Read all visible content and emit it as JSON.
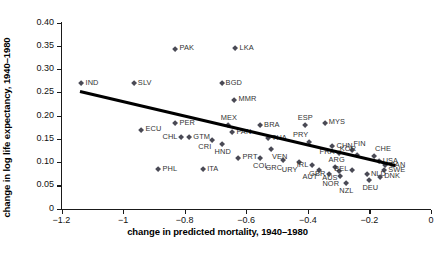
{
  "chart_data": {
    "type": "scatter",
    "title": "",
    "xlabel": "change in predicted mortality, 1940–1980",
    "ylabel": "change in log life expectancy, 1940–1980",
    "xlim": [
      -1.2,
      0.0
    ],
    "ylim": [
      0.0,
      0.4
    ],
    "xticks": [
      "−1.2",
      "−1",
      "−0.8",
      "−0.6",
      "−0.4",
      "−0.2",
      "0"
    ],
    "xtick_values": [
      -1.2,
      -1.0,
      -0.8,
      -0.6,
      -0.4,
      -0.2,
      0.0
    ],
    "yticks": [
      "0",
      "0.05",
      "0.10",
      "0.15",
      "0.20",
      "0.25",
      "0.30",
      "0.35",
      "0.40"
    ],
    "ytick_values": [
      0.0,
      0.05,
      0.1,
      0.15,
      0.2,
      0.25,
      0.3,
      0.35,
      0.4
    ],
    "grid": false,
    "legend": "none",
    "marker_color": "#4a4a55",
    "line_color": "#000000",
    "trendline": {
      "x0": -1.14,
      "y0": 0.2555,
      "x1": -0.115,
      "y1": 0.0965
    },
    "points": [
      {
        "label": "IND",
        "x": -1.135,
        "y": 0.2695,
        "pos": "r"
      },
      {
        "label": "SLV",
        "x": -0.965,
        "y": 0.269,
        "pos": "r"
      },
      {
        "label": "PAK",
        "x": -0.83,
        "y": 0.3435,
        "pos": "r"
      },
      {
        "label": "LKA",
        "x": -0.635,
        "y": 0.345,
        "pos": "r"
      },
      {
        "label": "BGD",
        "x": -0.68,
        "y": 0.269,
        "pos": "r"
      },
      {
        "label": "MMR",
        "x": -0.638,
        "y": 0.2335,
        "pos": "r"
      },
      {
        "label": "ECU",
        "x": -0.94,
        "y": 0.169,
        "pos": "r"
      },
      {
        "label": "PHL",
        "x": -0.885,
        "y": 0.084,
        "pos": "r"
      },
      {
        "label": "ITA",
        "x": -0.74,
        "y": 0.084,
        "pos": "r"
      },
      {
        "label": "PER",
        "x": -0.83,
        "y": 0.183,
        "pos": "r"
      },
      {
        "label": "CHL",
        "x": -0.81,
        "y": 0.153,
        "pos": "l"
      },
      {
        "label": "GTM",
        "x": -0.785,
        "y": 0.153,
        "pos": "r"
      },
      {
        "label": "MEX",
        "x": -0.66,
        "y": 0.179,
        "pos": "t"
      },
      {
        "label": "PAN",
        "x": -0.645,
        "y": 0.164,
        "pos": "r"
      },
      {
        "label": "CRI",
        "x": -0.71,
        "y": 0.148,
        "pos": "bl"
      },
      {
        "label": "HND",
        "x": -0.68,
        "y": 0.138,
        "pos": "b"
      },
      {
        "label": "BRA",
        "x": -0.555,
        "y": 0.179,
        "pos": "r"
      },
      {
        "label": "THA",
        "x": -0.53,
        "y": 0.151,
        "pos": "r"
      },
      {
        "label": "VEN",
        "x": -0.52,
        "y": 0.127,
        "pos": "br"
      },
      {
        "label": "COL",
        "x": -0.555,
        "y": 0.109,
        "pos": "b"
      },
      {
        "label": "PRT",
        "x": -0.625,
        "y": 0.109,
        "pos": "r"
      },
      {
        "label": "GRC",
        "x": -0.48,
        "y": 0.104,
        "pos": "bl"
      },
      {
        "label": "ESP",
        "x": -0.41,
        "y": 0.179,
        "pos": "t"
      },
      {
        "label": "MYS",
        "x": -0.345,
        "y": 0.184,
        "pos": "r"
      },
      {
        "label": "PRY",
        "x": -0.395,
        "y": 0.144,
        "pos": "tl"
      },
      {
        "label": "CHN",
        "x": -0.32,
        "y": 0.134,
        "pos": "r"
      },
      {
        "label": "URY",
        "x": -0.43,
        "y": 0.099,
        "pos": "bl"
      },
      {
        "label": "IRL",
        "x": -0.385,
        "y": 0.0925,
        "pos": "l"
      },
      {
        "label": "AUT",
        "x": -0.365,
        "y": 0.083,
        "pos": "bl"
      },
      {
        "label": "GBR",
        "x": -0.33,
        "y": 0.074,
        "pos": "l"
      },
      {
        "label": "FRA",
        "x": -0.3,
        "y": 0.12,
        "pos": "l"
      },
      {
        "label": "FIN",
        "x": -0.255,
        "y": 0.125,
        "pos": "tr"
      },
      {
        "label": "KOR",
        "x": -0.24,
        "y": 0.114,
        "pos": "tl"
      },
      {
        "label": "ARG",
        "x": -0.31,
        "y": 0.09,
        "pos": "t"
      },
      {
        "label": "AUS",
        "x": -0.3,
        "y": 0.081,
        "pos": "bl"
      },
      {
        "label": "BEL",
        "x": -0.255,
        "y": 0.083,
        "pos": "l"
      },
      {
        "label": "NOR",
        "x": -0.295,
        "y": 0.07,
        "pos": "bl"
      },
      {
        "label": "NZL",
        "x": -0.275,
        "y": 0.0545,
        "pos": "b"
      },
      {
        "label": "CHE",
        "x": -0.185,
        "y": 0.1135,
        "pos": "tr"
      },
      {
        "label": "USA",
        "x": -0.17,
        "y": 0.1015,
        "pos": "r"
      },
      {
        "label": "CAN",
        "x": -0.148,
        "y": 0.093,
        "pos": "r"
      },
      {
        "label": "SWE",
        "x": -0.152,
        "y": 0.082,
        "pos": "r"
      },
      {
        "label": "NLD",
        "x": -0.208,
        "y": 0.0735,
        "pos": "r"
      },
      {
        "label": "DNK",
        "x": -0.165,
        "y": 0.068,
        "pos": "r"
      },
      {
        "label": "DEU",
        "x": -0.2,
        "y": 0.062,
        "pos": "b"
      }
    ]
  }
}
